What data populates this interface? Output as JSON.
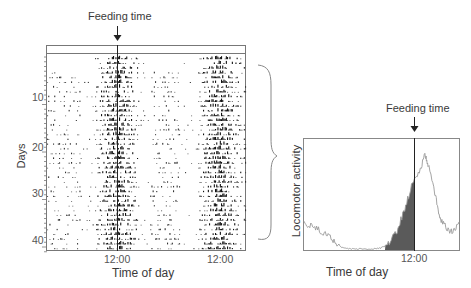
{
  "left_panel": {
    "annotation": "Feeding time",
    "ylabel": "Days",
    "xlabel": "Time of day",
    "yticks": [
      "10",
      "20",
      "30",
      "40"
    ],
    "xticks": [
      "12:00",
      "12:00"
    ]
  },
  "right_panel": {
    "annotation": "Feeding time",
    "ylabel": "Locomotor activity",
    "xlabel": "Time of day",
    "xticks": [
      "12:00"
    ]
  },
  "colors": {
    "axis": "#666666",
    "activity_bars": "#111111",
    "area_fill": "#555555",
    "line": "#999999"
  },
  "chart_data": [
    {
      "type": "heatmap",
      "title": "Double-plotted actogram",
      "xlabel": "Time of day",
      "ylabel": "Days",
      "ylim": [
        0,
        42
      ],
      "yticks": [
        10,
        20,
        30,
        40
      ],
      "xticks": [
        "12:00",
        "12:00"
      ],
      "annotations": [
        {
          "text": "Feeding time",
          "x": "12:00",
          "style": "arrow + vertical line"
        }
      ],
      "description": "Activity bouts concentrated around feeding time (12:00) each day across ~41 days; sparse anticipatory activity before feeding and scattered activity later in the day",
      "grid": false
    },
    {
      "type": "area",
      "title": "Mean daily activity profile",
      "xlabel": "Time of day",
      "ylabel": "Locomotor activity",
      "xticks": [
        "12:00"
      ],
      "annotations": [
        {
          "text": "Feeding time",
          "x": "12:00",
          "style": "arrow + vertical line"
        }
      ],
      "x": [
        0,
        0.05,
        0.1,
        0.15,
        0.2,
        0.25,
        0.3,
        0.35,
        0.4,
        0.45,
        0.5,
        0.55,
        0.6,
        0.65,
        0.7,
        0.75,
        0.78,
        0.8,
        0.85,
        0.88,
        0.92,
        0.96,
        1.0
      ],
      "series": [
        {
          "name": "activity (line)",
          "values": [
            0.25,
            0.22,
            0.18,
            0.14,
            0.08,
            0.02,
            0.01,
            0.01,
            0.01,
            0.01,
            0.02,
            0.06,
            0.18,
            0.38,
            0.62,
            0.74,
            0.88,
            0.8,
            0.48,
            0.28,
            0.2,
            0.16,
            0.26
          ]
        },
        {
          "name": "anticipatory activity (shaded)",
          "range": [
            "~07:00",
            "12:00"
          ]
        }
      ],
      "grid": false
    }
  ]
}
